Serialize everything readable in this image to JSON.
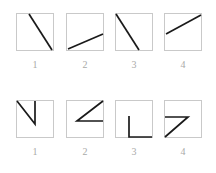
{
  "figure": {
    "background_color": "#ffffff",
    "box_border_color": "#c9c9c9",
    "stroke_color": "#1a1a1a",
    "label_color": "#a9a9a9",
    "box_size_px": 38,
    "rows": [
      {
        "name": "top-row",
        "description": "Four square panels each containing a single straight line segment",
        "panels": [
          {
            "label": "1",
            "shape_name": "steep-descending-diagonal",
            "points": "13,1 36,37"
          },
          {
            "label": "2",
            "shape_name": "shallow-ascending-diagonal",
            "points": "2,36 37,21"
          },
          {
            "label": "3",
            "shape_name": "corner-descending-diagonal",
            "points": "1,1 24,37"
          },
          {
            "label": "4",
            "shape_name": "shallow-ascending-diagonal-high",
            "points": "2,21 37,2"
          }
        ]
      },
      {
        "name": "bottom-row",
        "description": "Four square panels each containing a two-segment polyline",
        "panels": [
          {
            "label": "1",
            "shape_name": "v-checkmark-polyline",
            "points": "1,1 19,24 19,1"
          },
          {
            "label": "2",
            "shape_name": "arrow-left-polyline",
            "points": "37,1 11,21 37,21"
          },
          {
            "label": "3",
            "shape_name": "flag-right-polyline",
            "points": "14,16 14,37 37,37"
          },
          {
            "label": "4",
            "shape_name": "seven-polyline",
            "points": "1,17 24,17 1,37"
          }
        ]
      }
    ]
  }
}
